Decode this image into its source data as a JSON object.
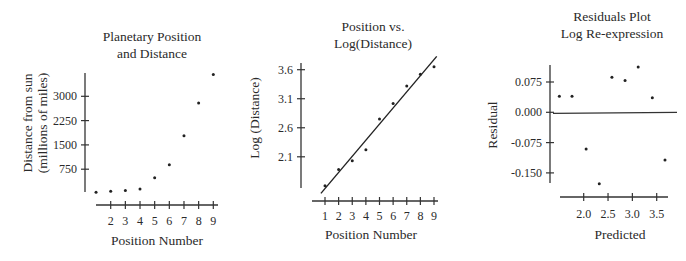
{
  "chart_data": [
    {
      "type": "scatter",
      "title": "Planetary Position and Distance",
      "title_lines": [
        "Planetary Position",
        "and Distance"
      ],
      "xlabel": "Position Number",
      "ylabel": "Distance from sun (millions of miles)",
      "ylabel_lines": [
        "Distance from sun",
        "(millions of miles)"
      ],
      "x_ticks": [
        2,
        3,
        4,
        5,
        6,
        7,
        8,
        9
      ],
      "y_ticks": [
        750,
        1500,
        2250,
        3000
      ],
      "xlim": [
        1,
        9
      ],
      "ylim": [
        0,
        3675
      ],
      "grid": false,
      "x": [
        1,
        2,
        3,
        4,
        5,
        6,
        7,
        8,
        9
      ],
      "y": [
        36,
        67,
        93,
        142,
        484,
        887,
        1784,
        2795,
        3675
      ]
    },
    {
      "type": "scatter",
      "title": "Position vs. Log(Distance)",
      "title_lines": [
        "Position vs.",
        "Log(Distance)"
      ],
      "xlabel": "Position Number",
      "ylabel": "Log (Distance)",
      "x_ticks": [
        1,
        2,
        3,
        4,
        5,
        6,
        7,
        8,
        9
      ],
      "y_ticks": [
        2.1,
        2.6,
        3.1,
        3.6
      ],
      "xlim": [
        1,
        9
      ],
      "ylim": [
        1.5,
        3.7
      ],
      "grid": false,
      "x": [
        1,
        2,
        3,
        4,
        5,
        6,
        7,
        8,
        9
      ],
      "y": [
        1.6,
        1.88,
        2.03,
        2.22,
        2.75,
        3.02,
        3.32,
        3.52,
        3.65
      ],
      "regression_line": {
        "x": [
          0.7,
          9.2
        ],
        "y": [
          1.47,
          3.83
        ]
      }
    },
    {
      "type": "scatter",
      "title": "Residuals Plot Log Re-expression",
      "title_lines": [
        "Residuals Plot",
        "Log Re-expression"
      ],
      "xlabel": "Predicted",
      "ylabel": "Residual",
      "x_ticks": [
        2.0,
        2.5,
        3.0,
        3.5
      ],
      "x_tick_labels": [
        "2.0",
        "2.5",
        "3.0",
        "3.5"
      ],
      "y_ticks": [
        0.075,
        0.0,
        -0.075,
        -0.15
      ],
      "y_tick_labels": [
        "0.075",
        "0.000",
        "-0.075",
        "-0.150"
      ],
      "xlim": [
        1.4,
        3.7
      ],
      "ylim": [
        -0.18,
        0.12
      ],
      "grid": false,
      "x": [
        1.5,
        1.76,
        2.05,
        2.32,
        2.58,
        2.85,
        3.12,
        3.41,
        3.67
      ],
      "y": [
        0.04,
        0.04,
        -0.091,
        -0.177,
        0.087,
        0.079,
        0.112,
        0.036,
        -0.118
      ],
      "reference_line": 0.0
    }
  ]
}
